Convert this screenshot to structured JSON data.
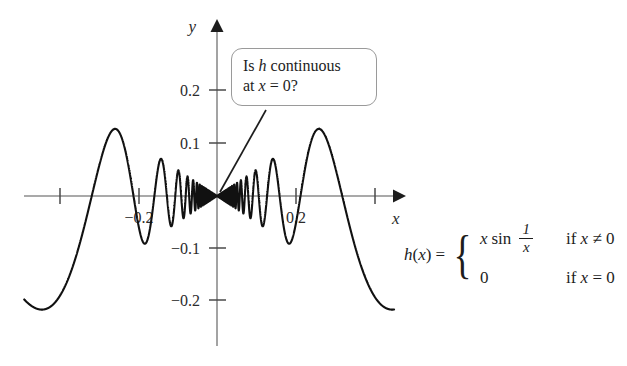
{
  "figure": {
    "axis_labels": {
      "x": "x",
      "y": "y"
    },
    "y_ticks": [
      {
        "value": 0.2,
        "label": "0.2"
      },
      {
        "value": 0.1,
        "label": "0.1"
      },
      {
        "value": -0.1,
        "label": "−0.1"
      },
      {
        "value": -0.2,
        "label": "−0.2"
      }
    ],
    "x_ticks": [
      {
        "value": -0.2,
        "label": "−0.2"
      },
      {
        "value": -0.1,
        "label": ""
      },
      {
        "value": 0.1,
        "label": ""
      },
      {
        "value": 0.2,
        "label": "0.2"
      }
    ],
    "colors": {
      "curve": "#111111",
      "axis": "#8c8c8c",
      "arrow": "#1d1d1d",
      "callout_border": "#9a9a9a",
      "text": "#1d1d1d",
      "background": "#ffffff"
    }
  },
  "callout": {
    "line1_pre": "Is ",
    "line1_var": "h",
    "line1_post": " continuous",
    "line2_pre": "at ",
    "line2_var": "x",
    "line2_post": " = 0?"
  },
  "formula": {
    "lhs_fn": "h",
    "lhs_open": "(",
    "lhs_arg": "x",
    "lhs_close": ")",
    "equals": "=",
    "case1_var": "x",
    "case1_fn": "sin",
    "case1_num": "1",
    "case1_den": "x",
    "case1_cond_if": "if ",
    "case1_cond_var": "x",
    "case1_cond_rel": " ≠ 0",
    "case2_value": "0",
    "case2_cond_if": "if ",
    "case2_cond_var": "x",
    "case2_cond_rel": " = 0"
  },
  "chart_data": {
    "type": "line",
    "title": "",
    "xlabel": "x",
    "ylabel": "y",
    "function": "h(x) = x sin(1/x)",
    "definition": {
      "x_nonzero": "x sin(1/x)",
      "x_zero": 0
    },
    "xlim": [
      -0.245,
      0.225
    ],
    "ylim": [
      -0.26,
      0.28
    ],
    "grid": false,
    "legend": null,
    "x_tick_values": [
      -0.2,
      -0.1,
      0.1,
      0.2
    ],
    "x_tick_labels": [
      "−0.2",
      "",
      "",
      "0.2"
    ],
    "y_tick_values": [
      0.2,
      0.1,
      -0.1,
      -0.2
    ],
    "y_tick_labels": [
      "0.2",
      "0.1",
      "−0.1",
      "−0.2"
    ],
    "envelope": {
      "upper": "|x|",
      "lower": "-|x|"
    },
    "annotations": [
      {
        "text": "Is h continuous at x = 0?",
        "points_to_x": 0.0,
        "points_to_y": 0.0
      }
    ],
    "notable_points": [
      {
        "x": -0.232,
        "y": 0.1,
        "note": "left endpoint of plotted curve"
      },
      {
        "x": -0.199,
        "y": -0.199,
        "note": "left local minimum (touches -|x| envelope)"
      },
      {
        "x": -0.134,
        "y": 0.13,
        "note": "local maximum"
      },
      {
        "x": -0.096,
        "y": -0.094,
        "note": "local minimum"
      },
      {
        "x": -0.074,
        "y": 0.072,
        "note": "local maximum"
      },
      {
        "x": 0.0,
        "y": 0.0,
        "note": "h(0) = 0, defined value; oscillation accumulates here"
      },
      {
        "x": 0.074,
        "y": -0.072,
        "note": "local minimum"
      },
      {
        "x": 0.096,
        "y": 0.094,
        "note": "local maximum"
      },
      {
        "x": 0.134,
        "y": -0.13,
        "note": "local minimum"
      },
      {
        "x": 0.199,
        "y": 0.199,
        "note": "right local maximum (touches |x| envelope)"
      },
      {
        "x": 0.224,
        "y": 0.1,
        "note": "right endpoint of plotted curve"
      }
    ]
  }
}
